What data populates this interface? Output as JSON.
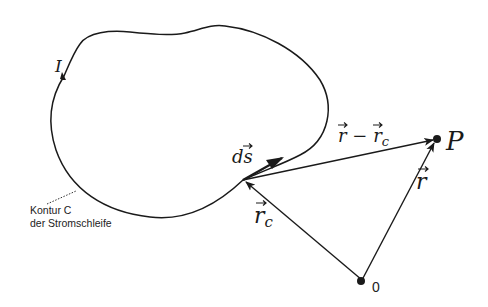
{
  "diagram": {
    "type": "physics-vector-diagram",
    "colors": {
      "background": "#ffffff",
      "stroke": "#1a1a1a"
    },
    "labels": {
      "current": "I",
      "line_element": "ds",
      "difference_vector": "r − r",
      "difference_vector_sub": "c",
      "point": "P",
      "position_vector": "r",
      "source_vector": "r",
      "source_vector_sub": "c",
      "origin": "0",
      "contour_line1": "Kontur C",
      "contour_line2": "der Stromschleife"
    },
    "nodes": [
      {
        "id": "origin",
        "label": "0",
        "x": 362,
        "y": 280
      },
      {
        "id": "P",
        "label": "P",
        "x": 437,
        "y": 139
      },
      {
        "id": "source-point",
        "label": "",
        "x": 243,
        "y": 180
      }
    ],
    "edges": [
      {
        "from": "origin",
        "to": "P",
        "label": "r⃗"
      },
      {
        "from": "origin",
        "to": "source-point",
        "label": "r⃗_c"
      },
      {
        "from": "source-point",
        "to": "P",
        "label": "r⃗ − r⃗_c"
      },
      {
        "from": "source-point",
        "to": "tangent",
        "label": "ds⃗"
      }
    ]
  }
}
